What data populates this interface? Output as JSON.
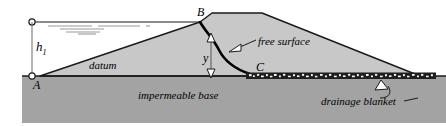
{
  "figure": {
    "colors": {
      "embankment_fill": "#c8c8c8",
      "base_fill": "#a3a3a3",
      "outline": "#1a1a1a",
      "free_surface": "#000000",
      "background": "#ffffff",
      "drainage_fill": "#1a1a1a",
      "drainage_grain": "#ffffff"
    },
    "labels": {
      "point_b": "B",
      "point_c": "C",
      "point_a": "A",
      "head": "h",
      "head_subscript": "1",
      "height_y": "y",
      "datum": "datum",
      "free_surface": "free surface",
      "impermeable_base": "impermeable base",
      "drainage_blanket": "drainage blanket"
    },
    "annotations": {
      "water_level_marker": "water-surface-triangle",
      "leader_free_surface": "arrow pointing to free surface curve",
      "leader_drainage": "arrow pointing to drainage blanket",
      "dimension_h1": "vertical dimension from water surface to base at A",
      "dimension_y": "vertical dimension from free surface down to base"
    }
  }
}
